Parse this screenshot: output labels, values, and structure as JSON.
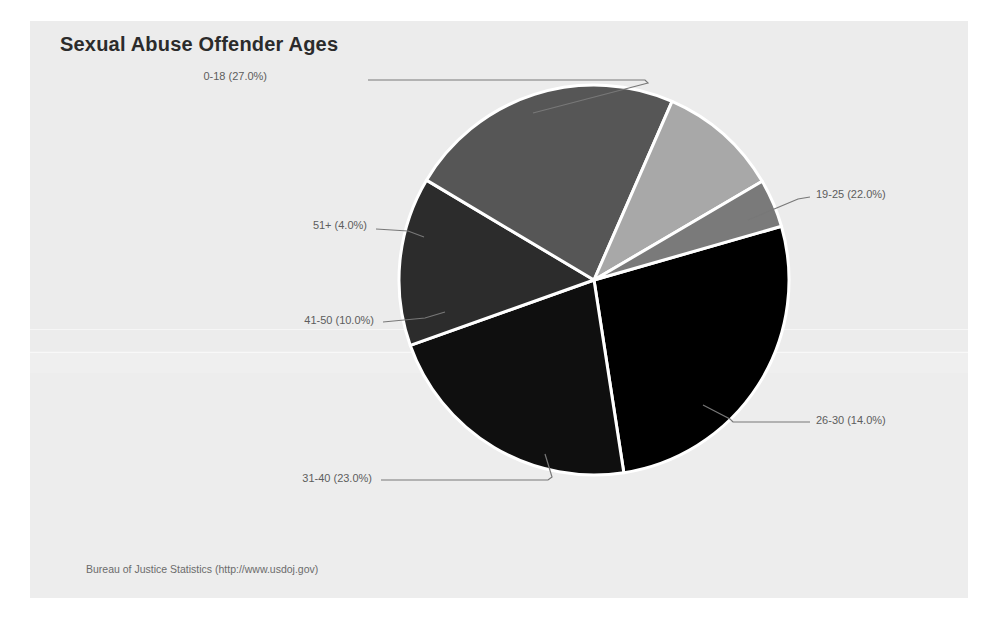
{
  "chart_data": {
    "type": "pie",
    "title": "Sexual Abuse Offender Ages",
    "source": "Bureau of Justice Statistics (http://www.usdoj.gov)",
    "xlabel": "",
    "ylabel": "",
    "legend_position": "none",
    "grid": false,
    "labels_show_percent": true,
    "categories": [
      "0-18",
      "19-25",
      "26-30",
      "31-40",
      "41-50",
      "51+"
    ],
    "values": [
      27.0,
      22.0,
      14.0,
      23.0,
      10.0,
      4.0
    ],
    "units": "percent",
    "slices": [
      {
        "label": "0-18",
        "percent": 27.0,
        "display": "0-18 (27.0%)",
        "color": "#000000",
        "label_x": 267,
        "label_y": 70,
        "label_align": "right",
        "leader": "M 368,80 L 645,80 L 648,83 L 533,113"
      },
      {
        "label": "19-25",
        "percent": 22.0,
        "display": "19-25 (22.0%)",
        "color": "#0f0f0f",
        "label_x": 816,
        "label_y": 188,
        "label_align": "left",
        "leader": "M 810,197 L 798,199 L 748,220"
      },
      {
        "label": "26-30",
        "percent": 14.0,
        "display": "26-30 (14.0%)",
        "color": "#2c2c2c",
        "label_x": 816,
        "label_y": 414,
        "label_align": "left",
        "leader": "M 810,422 L 733,422 L 730,419 L 703,405"
      },
      {
        "label": "31-40",
        "percent": 23.0,
        "display": "31-40 (23.0%)",
        "color": "#565656",
        "label_x": 372,
        "label_y": 472,
        "label_align": "right",
        "leader": "M 381,480 L 548,480 L 552,477 L 545,454"
      },
      {
        "label": "41-50",
        "percent": 10.0,
        "display": "41-50 (10.0%)",
        "color": "#a8a8a8",
        "label_x": 374,
        "label_y": 314,
        "label_align": "right",
        "leader": "M 383,322 L 425,318 L 445,312"
      },
      {
        "label": "51+",
        "percent": 4.0,
        "display": "51+ (4.0%)",
        "color": "#7a7a7a",
        "label_x": 367,
        "label_y": 219,
        "label_align": "right",
        "leader": "M 376,229 L 408,231 L 424,237"
      }
    ],
    "geometry": {
      "center_x": 594,
      "center_y": 280,
      "radius": 195,
      "start_angle_deg": -16,
      "direction": "clockwise",
      "separator_color": "#ffffff",
      "separator_width": 3
    }
  },
  "panel": {
    "background_color": "#ececec",
    "page_background_color": "#ffffff"
  }
}
